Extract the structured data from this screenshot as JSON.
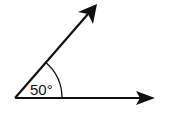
{
  "diagram": {
    "type": "angle",
    "angle_label": "50°",
    "angle_degrees": 50,
    "colors": {
      "stroke": "#111111",
      "background": "#ffffff"
    },
    "rays": [
      {
        "name": "horizontal-ray",
        "direction": "right"
      },
      {
        "name": "inclined-ray",
        "direction": "up-right"
      }
    ]
  }
}
